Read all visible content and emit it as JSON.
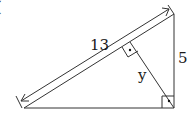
{
  "diagram": {
    "type": "right-triangle-altitude",
    "labels": {
      "hypotenuse": "13",
      "leg": "5",
      "altitude": "y",
      "corner_mark": "("
    },
    "colors": {
      "stroke": "#333333",
      "text": "#1a1a1a",
      "background": "#ffffff"
    }
  }
}
